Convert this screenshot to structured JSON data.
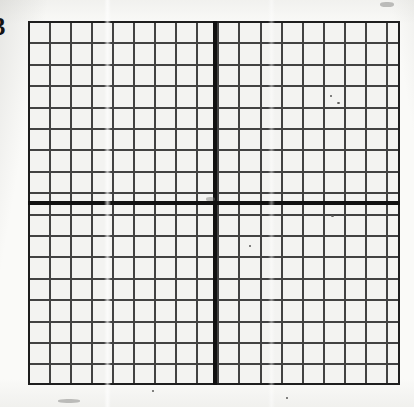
{
  "document": {
    "kind": "scanned-graph-paper",
    "page_width": 414,
    "page_height": 407,
    "paper_color": "#faf9f7",
    "cell_fill_color": "#f3f3f1",
    "grid_line_color": "#2a2a2a",
    "axis_color": "#111111",
    "border_color": "#1e1e1e"
  },
  "edge_mark": {
    "text": "3",
    "description": "partial digit cropped at the left page edge"
  },
  "grid": {
    "label": "coordinate-grid",
    "left": 28,
    "top": 21,
    "width": 372,
    "height": 364,
    "columns": 18,
    "rows": 17,
    "cell_width": 21.05,
    "cell_height": 21.4,
    "minor_line_width": 2,
    "border_width": 2
  },
  "axes": {
    "vertical": {
      "label": "y-axis",
      "x": 213,
      "thickness": 4,
      "columns_left": 9,
      "columns_right": 9
    },
    "horizontal": {
      "label": "x-axis",
      "y": 201,
      "thickness": 4,
      "rows_above": 8,
      "rows_below": 9
    }
  },
  "scan_artifacts": {
    "streaks": [
      {
        "x": 104,
        "opacity": 0.8
      },
      {
        "x": 268,
        "opacity": 0.5
      }
    ],
    "specks": [
      {
        "x": 330,
        "y": 95,
        "w": 2,
        "h": 2
      },
      {
        "x": 337,
        "y": 102,
        "w": 3,
        "h": 2
      },
      {
        "x": 331,
        "y": 215,
        "w": 3,
        "h": 2
      },
      {
        "x": 249,
        "y": 245,
        "w": 2,
        "h": 2
      },
      {
        "x": 152,
        "y": 390,
        "w": 2,
        "h": 2
      },
      {
        "x": 286,
        "y": 397,
        "w": 2,
        "h": 2
      }
    ],
    "smudges": [
      {
        "x": 206,
        "y": 197,
        "w": 9,
        "h": 4
      },
      {
        "x": 380,
        "y": 2,
        "w": 14,
        "h": 5
      },
      {
        "x": 58,
        "y": 399,
        "w": 22,
        "h": 4
      }
    ]
  }
}
